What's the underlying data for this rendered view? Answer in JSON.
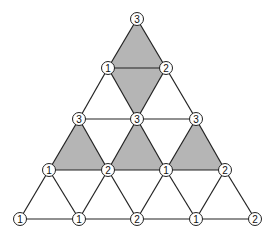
{
  "diagram": {
    "title": "",
    "shade_color": "#b5b5b5",
    "vertices": [
      {
        "id": "v0",
        "x": 137,
        "y": 19,
        "label": "3"
      },
      {
        "id": "v1",
        "x": 108,
        "y": 68,
        "label": "1"
      },
      {
        "id": "v2",
        "x": 166,
        "y": 68,
        "label": "2"
      },
      {
        "id": "v3",
        "x": 79,
        "y": 119,
        "label": "3"
      },
      {
        "id": "v4",
        "x": 137,
        "y": 119,
        "label": "3"
      },
      {
        "id": "v5",
        "x": 196,
        "y": 119,
        "label": "3"
      },
      {
        "id": "v6",
        "x": 49,
        "y": 170,
        "label": "1"
      },
      {
        "id": "v7",
        "x": 108,
        "y": 170,
        "label": "2"
      },
      {
        "id": "v8",
        "x": 166,
        "y": 170,
        "label": "1"
      },
      {
        "id": "v9",
        "x": 225,
        "y": 170,
        "label": "2"
      },
      {
        "id": "v10",
        "x": 20,
        "y": 219,
        "label": "1"
      },
      {
        "id": "v11",
        "x": 79,
        "y": 219,
        "label": "1"
      },
      {
        "id": "v12",
        "x": 137,
        "y": 219,
        "label": "2"
      },
      {
        "id": "v13",
        "x": 196,
        "y": 219,
        "label": "1"
      },
      {
        "id": "v14",
        "x": 255,
        "y": 219,
        "label": "2"
      }
    ],
    "shaded_triangles": [
      [
        "v0",
        "v1",
        "v2"
      ],
      [
        "v1",
        "v2",
        "v4"
      ],
      [
        "v3",
        "v6",
        "v7"
      ],
      [
        "v4",
        "v7",
        "v8"
      ],
      [
        "v5",
        "v8",
        "v9"
      ]
    ]
  }
}
